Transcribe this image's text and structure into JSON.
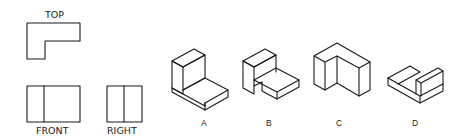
{
  "orthographic_views": {
    "top": {
      "label": "TOP"
    },
    "front": {
      "label": "FRONT"
    },
    "right": {
      "label": "RIGHT"
    }
  },
  "options": [
    {
      "id": "A",
      "label": "A"
    },
    {
      "id": "B",
      "label": "B"
    },
    {
      "id": "C",
      "label": "C"
    },
    {
      "id": "D",
      "label": "D"
    }
  ],
  "colors": {
    "line": "#1a1a1a",
    "background": "#ffffff"
  }
}
